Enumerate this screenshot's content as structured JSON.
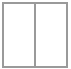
{
  "icon": {
    "name": "split-columns-icon",
    "panes": 2,
    "colors": {
      "border": "#9a9a9a",
      "fill": "#ffffff"
    }
  }
}
